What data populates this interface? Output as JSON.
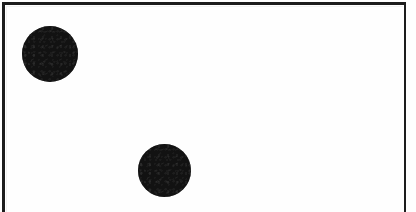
{
  "figure": {
    "kind": "geometric-figure",
    "canvas": {
      "width": 416,
      "height": 212
    },
    "background_color": "#ffffff",
    "plate_color": "#fefefe",
    "ink_color": "#121212"
  },
  "frame": {
    "name": "rectangular-border",
    "color": "#1c1c1c",
    "stroke_width_px": 3,
    "left_px": 2,
    "top_px": 2,
    "right_edge_px": 406,
    "bottom_visible": false,
    "note": "bottom border cropped outside image"
  },
  "shapes": [
    {
      "id": "dot-1",
      "type": "circle",
      "label": "upper-left dot",
      "fill": "#121212",
      "center_x": 50,
      "center_y": 54,
      "diameter": 56,
      "radius": 28
    },
    {
      "id": "dot-2",
      "type": "circle",
      "label": "lower-middle dot",
      "fill": "#121212",
      "center_x": 164,
      "center_y": 170,
      "diameter": 53,
      "radius": 26.5
    }
  ]
}
